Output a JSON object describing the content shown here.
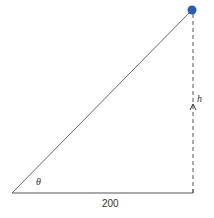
{
  "diagram": {
    "type": "right-triangle",
    "labels": {
      "angle": "θ",
      "base": "200",
      "height": "h"
    },
    "colors": {
      "ball": "#2a5db0",
      "line": "#555555"
    }
  }
}
